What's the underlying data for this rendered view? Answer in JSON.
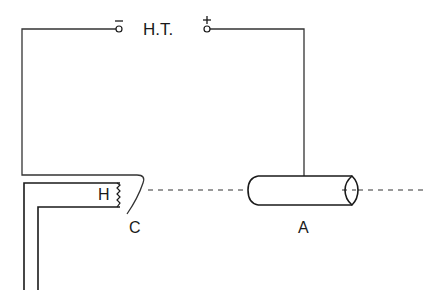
{
  "diagram": {
    "labels": {
      "power_supply": "H.T.",
      "negative_sign": "−",
      "positive_sign": "+",
      "heater": "H",
      "cathode": "C",
      "anode": "A"
    },
    "colors": {
      "stroke": "#1a1a1a",
      "wire": "#333333",
      "background": "#ffffff"
    }
  }
}
